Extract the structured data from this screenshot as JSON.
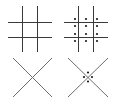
{
  "figure": {
    "panels": [
      {
        "id": "grid-plain",
        "type": "tic-tac-toe-grid",
        "dots": false
      },
      {
        "id": "grid-dotted",
        "type": "tic-tac-toe-grid",
        "dots": true
      },
      {
        "id": "cross-plain",
        "type": "diagonal-cross",
        "dots": false
      },
      {
        "id": "cross-dotted",
        "type": "diagonal-cross",
        "dots": true
      }
    ],
    "colors": {
      "line": "#3a3a3a",
      "cross_line": "#6e6e6e",
      "dot": "#1a1a1a",
      "background": "#ffffff"
    }
  }
}
